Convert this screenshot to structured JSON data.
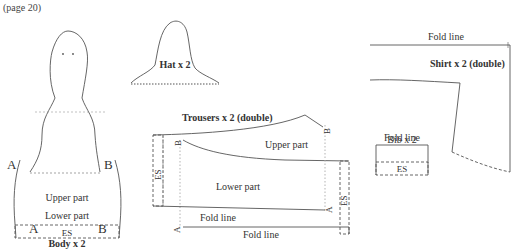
{
  "page_ref": "(page 20)",
  "pieces": {
    "body": {
      "title": "Body x 2",
      "upper": "Upper part",
      "lower": "Lower part",
      "mark_a": "A",
      "mark_b": "B",
      "es": "ES"
    },
    "hat": {
      "title": "Hat x 2"
    },
    "trousers": {
      "title": "Trousers x 2 (double)",
      "upper": "Upper part",
      "lower": "Lower part",
      "mark_a": "A",
      "mark_b": "B",
      "es": "ES",
      "fold_line_inner": "Fold line",
      "fold_line_outer": "Fold line"
    },
    "shirt": {
      "title": "Shirt x 2 (double)",
      "fold_line": "Fold line"
    },
    "bib": {
      "title": "Bib x 2",
      "fold_line": "Fold line",
      "es": "ES"
    }
  }
}
